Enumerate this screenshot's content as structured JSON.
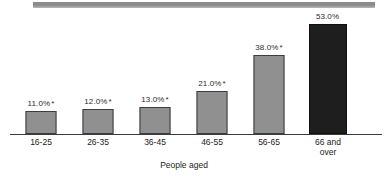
{
  "chart_data": {
    "type": "bar",
    "title": "",
    "subtitle": "",
    "xlabel": "People aged",
    "ylabel": "",
    "ylim": [
      0,
      60
    ],
    "grid": false,
    "legend": "none",
    "axis_visible": {
      "x": true,
      "y": false
    },
    "categories": [
      "16-25",
      "26-35",
      "36-45",
      "46-55",
      "56-65",
      "66 and over"
    ],
    "values": [
      11.0,
      12.0,
      13.0,
      21.0,
      38.0,
      53.0
    ],
    "data_labels": [
      "11.0%",
      "12.0%",
      "13.0%",
      "21.0%",
      "38.0%",
      "53.0%"
    ],
    "annotations": [
      "*",
      "*",
      "*",
      "*",
      "*",
      ""
    ],
    "series": [
      {
        "name": "People aged",
        "values": [
          11.0,
          12.0,
          13.0,
          21.0,
          38.0,
          53.0
        ]
      }
    ],
    "colors": {
      "bar_fill": "#909090",
      "bar_stroke": "#3d3d3d",
      "highlight_fill": "#1e1e1e",
      "highlight_stroke": "#101010",
      "axis": "#3b3b3b",
      "text": "#232323",
      "top_rule": "#8c8c8c",
      "background": "#ffffff"
    }
  },
  "bars": [
    {
      "category": "16-25",
      "label_line1": "16-25",
      "label_line2": "",
      "value": 11.0,
      "data_label": "11.0%",
      "star": "*",
      "highlighted": false
    },
    {
      "category": "26-35",
      "label_line1": "26-35",
      "label_line2": "",
      "value": 12.0,
      "data_label": "12.0%",
      "star": "*",
      "highlighted": false
    },
    {
      "category": "36-45",
      "label_line1": "36-45",
      "label_line2": "",
      "value": 13.0,
      "data_label": "13.0%",
      "star": "*",
      "highlighted": false
    },
    {
      "category": "46-55",
      "label_line1": "46-55",
      "label_line2": "",
      "value": 21.0,
      "data_label": "21.0%",
      "star": "*",
      "highlighted": false
    },
    {
      "category": "56-65",
      "label_line1": "56-65",
      "label_line2": "",
      "value": 38.0,
      "data_label": "38.0%",
      "star": "*",
      "highlighted": false
    },
    {
      "category": "66 and over",
      "label_line1": "66 and",
      "label_line2": "over",
      "value": 53.0,
      "data_label": "53.0%",
      "star": "",
      "highlighted": true
    }
  ],
  "axis": {
    "title": "People aged"
  }
}
